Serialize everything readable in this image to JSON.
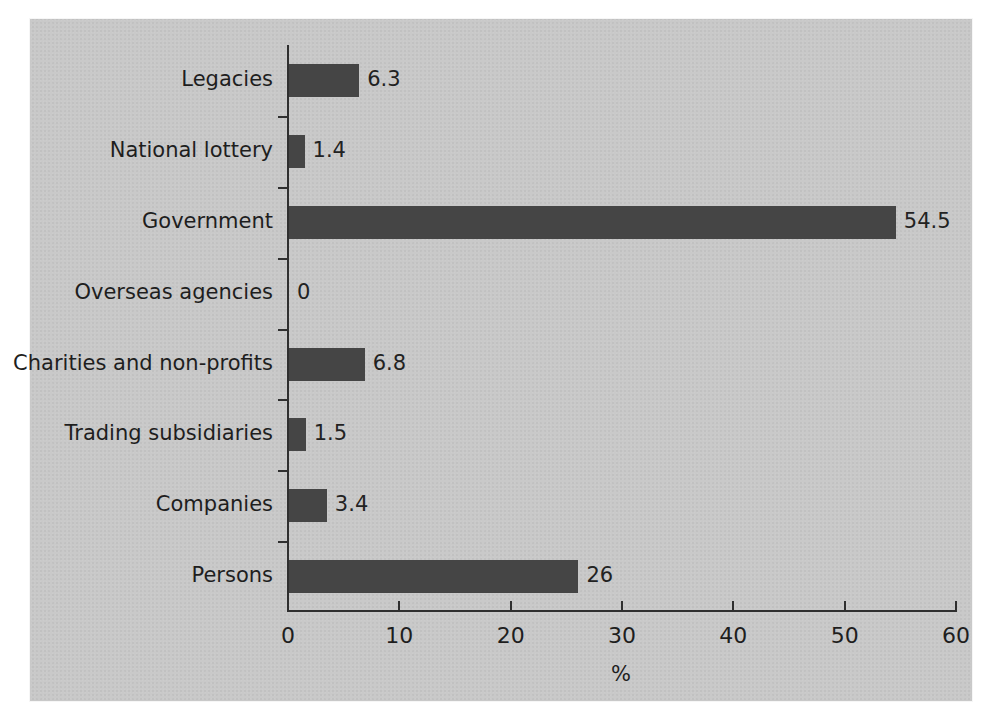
{
  "chart_data": {
    "type": "bar",
    "orientation": "horizontal",
    "title": "",
    "subtitle": "",
    "xlabel": "%",
    "ylabel": "",
    "xlim": [
      0,
      60
    ],
    "xticks": [
      "0",
      "10",
      "20",
      "30",
      "40",
      "50",
      "60"
    ],
    "grid": false,
    "legend": null,
    "bar_color": "#454545",
    "background_color": "#c9c9c9",
    "categories": [
      "Legacies",
      "National lottery",
      "Government",
      "Overseas agencies",
      "Charities and non-profits",
      "Trading subsidiaries",
      "Companies",
      "Persons"
    ],
    "values": [
      6.3,
      1.4,
      54.5,
      0,
      6.8,
      1.5,
      3.4,
      26
    ],
    "value_labels": [
      "6.3",
      "1.4",
      "54.5",
      "0",
      "6.8",
      "1.5",
      "3.4",
      "26"
    ],
    "series": [
      {
        "name": "Share of income",
        "values": [
          6.3,
          1.4,
          54.5,
          0,
          6.8,
          1.5,
          3.4,
          26
        ]
      }
    ]
  }
}
